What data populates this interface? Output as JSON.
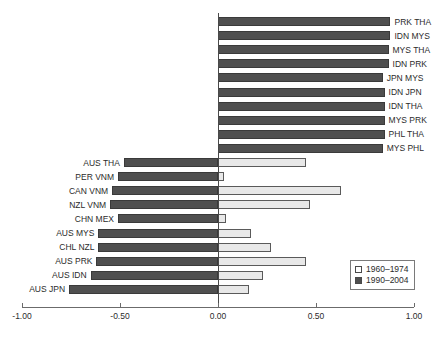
{
  "chart_data": {
    "type": "bar",
    "orientation": "horizontal",
    "title": "",
    "subtitle": "",
    "xlabel": "",
    "ylabel": "",
    "xlim": [
      -1.0,
      1.0
    ],
    "xticks": [
      -1.0,
      -0.5,
      0.0,
      0.5,
      1.0
    ],
    "xtick_labels": [
      "-1.00",
      "-0.50",
      "0.00",
      "0.50",
      "1.00"
    ],
    "grid": false,
    "legend": {
      "position": "bottom-right",
      "entries": [
        {
          "name": "1960–1974",
          "color": "#e8e8e8",
          "key": "early"
        },
        {
          "name": "1990–2004",
          "color": "#4f4f4f",
          "key": "late"
        }
      ]
    },
    "series": [
      {
        "name": "1960–1974",
        "key": "early",
        "color": "#e8e8e8"
      },
      {
        "name": "1990–2004",
        "key": "late",
        "color": "#4f4f4f"
      }
    ],
    "categories": [
      "PRK THA",
      "IDN MYS",
      "MYS THA",
      "IDN PRK",
      "JPN MYS",
      "IDN JPN",
      "IDN THA",
      "MYS PRK",
      "PHL THA",
      "MYS PHL",
      "AUS THA",
      "PER VNM",
      "CAN VNM",
      "NZL VNM",
      "CHN MEX",
      "AUS MYS",
      "CHL NZL",
      "AUS PRK",
      "AUS IDN",
      "AUS JPN"
    ],
    "rows": [
      {
        "category": "PRK THA",
        "label_side": "right",
        "early": 0.4,
        "late": 0.88
      },
      {
        "category": "IDN MYS",
        "label_side": "right",
        "early": 0.79,
        "late": 0.88
      },
      {
        "category": "MYS THA",
        "label_side": "right",
        "early": 0.76,
        "late": 0.87
      },
      {
        "category": "IDN PRK",
        "label_side": "right",
        "early": 0.52,
        "late": 0.87
      },
      {
        "category": "JPN MYS",
        "label_side": "right",
        "early": 0.34,
        "late": 0.84
      },
      {
        "category": "IDN JPN",
        "label_side": "right",
        "early": 0.47,
        "late": 0.85
      },
      {
        "category": "IDN THA",
        "label_side": "right",
        "early": 0.66,
        "late": 0.85
      },
      {
        "category": "MYS PRK",
        "label_side": "right",
        "early": 0.2,
        "late": 0.85
      },
      {
        "category": "PHL THA",
        "label_side": "right",
        "early": 0.57,
        "late": 0.85
      },
      {
        "category": "MYS PHL",
        "label_side": "right",
        "early": 0.79,
        "late": 0.84
      },
      {
        "category": "AUS THA",
        "label_side": "left",
        "early": 0.45,
        "late": -0.48
      },
      {
        "category": "PER VNM",
        "label_side": "left",
        "early": 0.03,
        "late": -0.51
      },
      {
        "category": "CAN VNM",
        "label_side": "left",
        "early": 0.63,
        "late": -0.54
      },
      {
        "category": "NZL VNM",
        "label_side": "left",
        "early": 0.47,
        "late": -0.55
      },
      {
        "category": "CHN MEX",
        "label_side": "left",
        "early": 0.04,
        "late": -0.51
      },
      {
        "category": "AUS MYS",
        "label_side": "left",
        "early": 0.17,
        "late": -0.61
      },
      {
        "category": "CHL NZL",
        "label_side": "left",
        "early": 0.27,
        "late": -0.61
      },
      {
        "category": "AUS PRK",
        "label_side": "left",
        "early": 0.45,
        "late": -0.62
      },
      {
        "category": "AUS IDN",
        "label_side": "left",
        "early": 0.23,
        "late": -0.65
      },
      {
        "category": "AUS JPN",
        "label_side": "left",
        "early": 0.16,
        "late": -0.76
      }
    ]
  }
}
